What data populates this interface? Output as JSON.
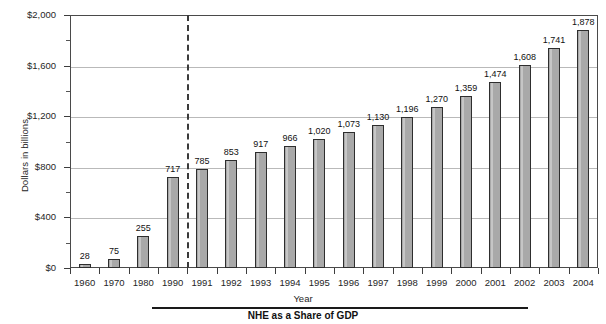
{
  "chart_data": {
    "type": "bar",
    "title": "",
    "xlabel": "Year",
    "ylabel": "Dollars in billions",
    "categories": [
      "1960",
      "1970",
      "1980",
      "1990",
      "1991",
      "1992",
      "1993",
      "1994",
      "1995",
      "1996",
      "1997",
      "1998",
      "1999",
      "2000",
      "2001",
      "2002",
      "2003",
      "2004"
    ],
    "values": [
      28,
      75,
      255,
      717,
      785,
      853,
      917,
      966,
      1020,
      1073,
      1130,
      1196,
      1270,
      1359,
      1474,
      1608,
      1741,
      1878
    ],
    "value_labels": [
      "28",
      "75",
      "255",
      "717",
      "785",
      "853",
      "917",
      "966",
      "1,020",
      "1,073",
      "1,130",
      "1,196",
      "1,270",
      "1,359",
      "1,474",
      "1,608",
      "1,741",
      "1,878"
    ],
    "ylim": [
      0,
      2000
    ],
    "y_ticks": [
      0,
      400,
      800,
      1200,
      1600,
      2000
    ],
    "y_tick_labels": [
      "$0",
      "$400",
      "$800",
      "$1,200",
      "$1,600",
      "$2,000"
    ],
    "y_minor_ticks": [
      200,
      600,
      1000,
      1400,
      1800
    ],
    "grid": "horizontal",
    "legend": "none",
    "bar_color": "#a9a9a9",
    "bar_edge_color": "#2e2e2e",
    "grid_color": "#b9b9b9",
    "annotations": [
      {
        "type": "vertical-dashed-line",
        "after_category": "1990",
        "style": "dashed",
        "color": "#3a3a3a"
      }
    ]
  },
  "caption": {
    "text": "NHE as a Share of GDP"
  }
}
